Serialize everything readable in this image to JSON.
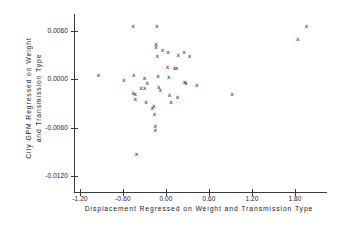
{
  "chart_data": {
    "type": "scatter",
    "title": "",
    "xlabel": "Displacement Regressed on Weight and Transmission Type",
    "ylabel_line1": "City GPM Regressed on Weight",
    "ylabel_line2": "and Transmission Type",
    "marker": "x",
    "grid": false,
    "legend": null,
    "xlim": [
      -1.45,
      2.1
    ],
    "ylim": [
      -0.0135,
      0.008
    ],
    "xticks": [
      -1.2,
      -0.6,
      0.0,
      0.6,
      1.2,
      1.8
    ],
    "xtick_labels": [
      "-1.20",
      "-0.60",
      "0.00",
      "0.60",
      "1.20",
      "1.80"
    ],
    "yticks": [
      0.006,
      0.0,
      -0.006,
      -0.012
    ],
    "ytick_labels": [
      "0.0060",
      "0.0000",
      "-0.0060",
      "-0.0120"
    ],
    "points": [
      {
        "x": -0.94,
        "y": 0.00055
      },
      {
        "x": -0.59,
        "y": -0.00015
      },
      {
        "x": -0.46,
        "y": 0.0065
      },
      {
        "x": -0.45,
        "y": 0.00055
      },
      {
        "x": -0.46,
        "y": -0.00175
      },
      {
        "x": -0.43,
        "y": -0.00185
      },
      {
        "x": -0.43,
        "y": -0.00245
      },
      {
        "x": -0.41,
        "y": -0.0093
      },
      {
        "x": -0.35,
        "y": -0.0011
      },
      {
        "x": -0.3,
        "y": 0.0001
      },
      {
        "x": -0.3,
        "y": -0.00115
      },
      {
        "x": -0.28,
        "y": -0.0029
      },
      {
        "x": -0.26,
        "y": -0.0005
      },
      {
        "x": -0.19,
        "y": -0.00355
      },
      {
        "x": -0.17,
        "y": -0.0033
      },
      {
        "x": -0.16,
        "y": -0.00435
      },
      {
        "x": -0.15,
        "y": -0.0058
      },
      {
        "x": -0.15,
        "y": -0.0063
      },
      {
        "x": -0.14,
        "y": 0.0043
      },
      {
        "x": -0.14,
        "y": 0.00395
      },
      {
        "x": -0.13,
        "y": 0.0065
      },
      {
        "x": -0.12,
        "y": 0.00285
      },
      {
        "x": -0.11,
        "y": 0.0004
      },
      {
        "x": -0.1,
        "y": -0.00105
      },
      {
        "x": -0.08,
        "y": -0.0014
      },
      {
        "x": -0.05,
        "y": 0.00355
      },
      {
        "x": 0.02,
        "y": 0.00145
      },
      {
        "x": 0.03,
        "y": 0.0033
      },
      {
        "x": 0.04,
        "y": 0.0003
      },
      {
        "x": 0.05,
        "y": -0.00195
      },
      {
        "x": 0.07,
        "y": -0.0029
      },
      {
        "x": 0.12,
        "y": 0.0014
      },
      {
        "x": 0.15,
        "y": 0.0014
      },
      {
        "x": 0.16,
        "y": -0.00225
      },
      {
        "x": 0.17,
        "y": 0.00295
      },
      {
        "x": 0.25,
        "y": 0.0033
      },
      {
        "x": 0.26,
        "y": -0.00035
      },
      {
        "x": 0.28,
        "y": -0.00045
      },
      {
        "x": 0.33,
        "y": 0.00285
      },
      {
        "x": 0.43,
        "y": -0.00075
      },
      {
        "x": 0.92,
        "y": -0.0019
      },
      {
        "x": 1.84,
        "y": 0.0049
      },
      {
        "x": 1.96,
        "y": 0.0066
      }
    ]
  }
}
